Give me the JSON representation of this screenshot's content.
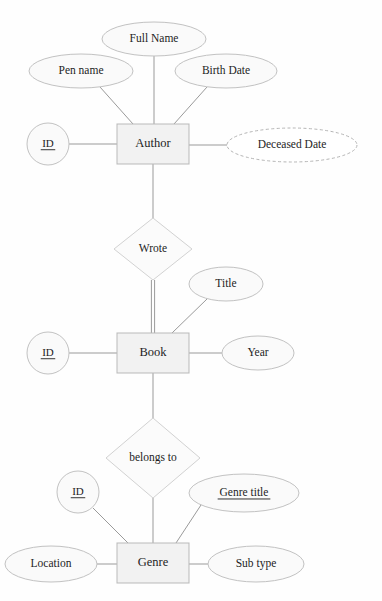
{
  "diagram": {
    "notation": "chen",
    "background_color": "#fefefe",
    "entity_fill": "#f2f2f2",
    "attribute_fill": "#fafafa",
    "relationship_fill": "#fbfbfb",
    "line_color": "#9a9a9a",
    "text_color": "#1d1d1d"
  },
  "entities": [
    {
      "id": "author",
      "label": "Author",
      "cx": 153,
      "cy": 144,
      "w": 72,
      "h": 40
    },
    {
      "id": "book",
      "label": "Book",
      "cx": 153,
      "cy": 353,
      "w": 72,
      "h": 40
    },
    {
      "id": "genre",
      "label": "Genre",
      "cx": 153,
      "cy": 563,
      "w": 72,
      "h": 40
    }
  ],
  "relationships": [
    {
      "id": "wrote",
      "label": "Wrote",
      "cx": 153,
      "cy": 249,
      "rx": 39,
      "ry": 31,
      "from": "author",
      "to": "book",
      "from_participation": "partial",
      "to_participation": "total"
    },
    {
      "id": "belongs-to",
      "label": "belongs to",
      "cx": 153,
      "cy": 458,
      "rx": 47,
      "ry": 40,
      "from": "book",
      "to": "genre",
      "from_participation": "partial",
      "to_participation": "partial"
    }
  ],
  "attributes": [
    {
      "id": "author-id",
      "label": "ID",
      "owner": "author",
      "key": true,
      "derived": false,
      "shape": "circle",
      "cx": 48,
      "cy": 144,
      "rx": 21,
      "ry": 21
    },
    {
      "id": "author-pen-name",
      "label": "Pen name",
      "owner": "author",
      "key": false,
      "derived": false,
      "shape": "ellipse",
      "cx": 81,
      "cy": 71,
      "rx": 52,
      "ry": 17
    },
    {
      "id": "author-full-name",
      "label": "Full Name",
      "owner": "author",
      "key": false,
      "derived": false,
      "shape": "ellipse",
      "cx": 154,
      "cy": 39,
      "rx": 52,
      "ry": 17
    },
    {
      "id": "author-birth-date",
      "label": "Birth Date",
      "owner": "author",
      "key": false,
      "derived": false,
      "shape": "ellipse",
      "cx": 226,
      "cy": 71,
      "rx": 51,
      "ry": 17
    },
    {
      "id": "author-deceased-date",
      "label": "Deceased Date",
      "owner": "author",
      "key": false,
      "derived": true,
      "shape": "ellipse",
      "cx": 292,
      "cy": 145,
      "rx": 65,
      "ry": 17
    },
    {
      "id": "book-id",
      "label": "ID",
      "owner": "book",
      "key": true,
      "derived": false,
      "shape": "circle",
      "cx": 48,
      "cy": 353,
      "rx": 21,
      "ry": 21
    },
    {
      "id": "book-title",
      "label": "Title",
      "owner": "book",
      "key": false,
      "derived": false,
      "shape": "ellipse",
      "cx": 226,
      "cy": 284,
      "rx": 37,
      "ry": 17
    },
    {
      "id": "book-year",
      "label": "Year",
      "owner": "book",
      "key": false,
      "derived": false,
      "shape": "ellipse",
      "cx": 258,
      "cy": 353,
      "rx": 36,
      "ry": 17
    },
    {
      "id": "genre-id",
      "label": "ID",
      "owner": "genre",
      "key": true,
      "derived": false,
      "shape": "circle",
      "cx": 78,
      "cy": 492,
      "rx": 21,
      "ry": 21
    },
    {
      "id": "genre-title",
      "label": "Genre title",
      "owner": "genre",
      "key": true,
      "derived": false,
      "shape": "ellipse",
      "cx": 244,
      "cy": 493,
      "rx": 55,
      "ry": 19
    },
    {
      "id": "genre-location",
      "label": "Location",
      "owner": "genre",
      "key": false,
      "derived": false,
      "shape": "ellipse",
      "cx": 51,
      "cy": 564,
      "rx": 46,
      "ry": 18
    },
    {
      "id": "genre-sub-type",
      "label": "Sub type",
      "owner": "genre",
      "key": false,
      "derived": false,
      "shape": "ellipse",
      "cx": 256,
      "cy": 564,
      "rx": 48,
      "ry": 18
    }
  ],
  "edges": [
    {
      "id": "edge-author-id",
      "x1": 69,
      "y1": 144,
      "x2": 117,
      "y2": 144,
      "double": false
    },
    {
      "id": "edge-author-pen-name",
      "x1": 100,
      "y1": 87,
      "x2": 133,
      "y2": 124,
      "double": false
    },
    {
      "id": "edge-author-full-name",
      "x1": 154,
      "y1": 56,
      "x2": 154,
      "y2": 124,
      "double": false
    },
    {
      "id": "edge-author-birth-date",
      "x1": 207,
      "y1": 87,
      "x2": 174,
      "y2": 124,
      "double": false
    },
    {
      "id": "edge-author-deceased-date",
      "x1": 189,
      "y1": 145,
      "x2": 227,
      "y2": 145,
      "double": false
    },
    {
      "id": "edge-author-wrote",
      "x1": 153,
      "y1": 164,
      "x2": 153,
      "y2": 218,
      "double": false
    },
    {
      "id": "edge-wrote-book",
      "x1": 153,
      "y1": 280,
      "x2": 153,
      "y2": 333,
      "double": true
    },
    {
      "id": "edge-book-id",
      "x1": 69,
      "y1": 353,
      "x2": 117,
      "y2": 353,
      "double": false
    },
    {
      "id": "edge-book-title",
      "x1": 207,
      "y1": 299,
      "x2": 172,
      "y2": 333,
      "double": false
    },
    {
      "id": "edge-book-year",
      "x1": 189,
      "y1": 353,
      "x2": 222,
      "y2": 353,
      "double": false
    },
    {
      "id": "edge-book-belongs-to",
      "x1": 153,
      "y1": 373,
      "x2": 153,
      "y2": 418,
      "double": false
    },
    {
      "id": "edge-belongs-to-genre",
      "x1": 153,
      "y1": 498,
      "x2": 153,
      "y2": 543,
      "double": false
    },
    {
      "id": "edge-genre-id",
      "x1": 93,
      "y1": 508,
      "x2": 128,
      "y2": 543,
      "double": false
    },
    {
      "id": "edge-genre-title",
      "x1": 201,
      "y1": 505,
      "x2": 176,
      "y2": 543,
      "double": false
    },
    {
      "id": "edge-genre-location",
      "x1": 97,
      "y1": 564,
      "x2": 117,
      "y2": 564,
      "double": false
    },
    {
      "id": "edge-genre-sub-type",
      "x1": 189,
      "y1": 564,
      "x2": 208,
      "y2": 564,
      "double": false
    }
  ]
}
